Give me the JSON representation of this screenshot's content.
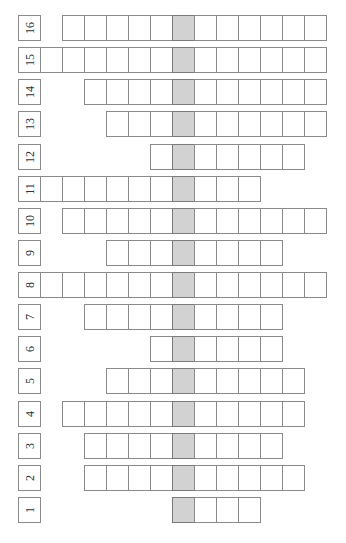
{
  "puzzle": {
    "type": "vertical-keyword-crossword",
    "orientation": "rotated-90",
    "key_column": 6,
    "colors": {
      "border": "#8a8a8a",
      "key_cell": "#d2d2d2",
      "label_text": "#333333",
      "background": "#ffffff"
    },
    "rows": [
      {
        "label": "16",
        "start": 1,
        "end": 12
      },
      {
        "label": "15",
        "start": 0,
        "end": 12
      },
      {
        "label": "14",
        "start": 2,
        "end": 12
      },
      {
        "label": "13",
        "start": 3,
        "end": 12
      },
      {
        "label": "12",
        "start": 5,
        "end": 11
      },
      {
        "label": "11",
        "start": 0,
        "end": 9
      },
      {
        "label": "10",
        "start": 1,
        "end": 12
      },
      {
        "label": "9",
        "start": 3,
        "end": 10
      },
      {
        "label": "8",
        "start": 0,
        "end": 12
      },
      {
        "label": "7",
        "start": 2,
        "end": 10
      },
      {
        "label": "6",
        "start": 5,
        "end": 10
      },
      {
        "label": "5",
        "start": 3,
        "end": 11
      },
      {
        "label": "4",
        "start": 1,
        "end": 11
      },
      {
        "label": "3",
        "start": 2,
        "end": 10
      },
      {
        "label": "2",
        "start": 2,
        "end": 11
      },
      {
        "label": "1",
        "start": 6,
        "end": 9
      }
    ]
  }
}
